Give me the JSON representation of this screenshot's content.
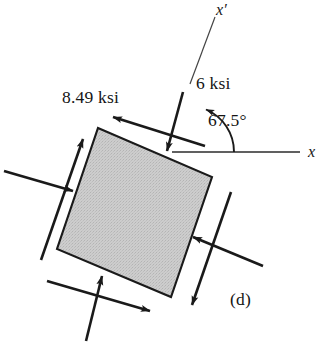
{
  "figure": {
    "part_label": "(d)",
    "labels": {
      "shear_stress": "8.49 ksi",
      "normal_stress": "6 ksi",
      "angle": "67.5°",
      "axis_x": "x",
      "axis_x_prime": "x′"
    },
    "colors": {
      "background": "#ffffff",
      "element_fill": "#c9c9c9",
      "stroke": "#1a1a1a",
      "thin_stroke": "#333333",
      "text": "#151515"
    },
    "element": {
      "shape": "square",
      "rotation_deg": 23.3,
      "corners": {
        "top_left": [
          98,
          128
        ],
        "top_right": [
          212,
          177
        ],
        "bottom_right": [
          171,
          297
        ],
        "bottom_left": [
          57,
          249
        ]
      }
    },
    "axes": {
      "x": {
        "from": [
          172,
          152
        ],
        "to": [
          300,
          152
        ],
        "angle_deg": 0
      },
      "x_prime": {
        "from": [
          190,
          83
        ],
        "to": [
          214,
          18
        ],
        "angle_deg": 67.5
      },
      "arc": {
        "center": [
          188,
          152
        ],
        "radius": 46,
        "start_deg": 0,
        "end_deg": 67.5
      }
    },
    "stress_arrows": [
      {
        "name": "top-face-normal",
        "type": "normal",
        "sense": "compression",
        "value": "6 ksi"
      },
      {
        "name": "top-face-shear",
        "type": "shear",
        "value": "8.49 ksi"
      },
      {
        "name": "bottom-face-normal",
        "type": "normal",
        "sense": "compression",
        "value": "6 ksi"
      },
      {
        "name": "bottom-face-shear",
        "type": "shear",
        "value": "8.49 ksi"
      },
      {
        "name": "left-face-normal",
        "type": "normal",
        "sense": "compression",
        "value": "6 ksi"
      },
      {
        "name": "left-face-shear",
        "type": "shear",
        "value": "8.49 ksi"
      },
      {
        "name": "right-face-normal",
        "type": "normal",
        "sense": "compression",
        "value": "6 ksi"
      },
      {
        "name": "right-face-shear",
        "type": "shear",
        "value": "8.49 ksi"
      }
    ]
  }
}
